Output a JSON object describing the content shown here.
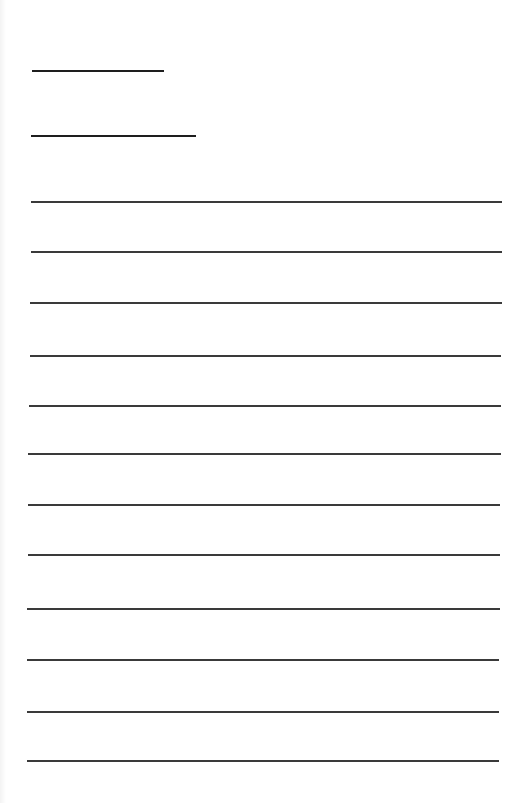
{
  "document": {
    "type": "blank lined form",
    "line_color": "#2b2b2b",
    "header_lines": [
      {
        "x1": 32,
        "x2": 164,
        "y": 71
      },
      {
        "x1": 31,
        "x2": 196,
        "y": 136
      }
    ],
    "body_lines": [
      {
        "x1": 31,
        "x2": 502,
        "y": 202
      },
      {
        "x1": 31,
        "x2": 502,
        "y": 252
      },
      {
        "x1": 30,
        "x2": 502,
        "y": 303
      },
      {
        "x1": 30,
        "x2": 501,
        "y": 356
      },
      {
        "x1": 29,
        "x2": 501,
        "y": 406
      },
      {
        "x1": 28,
        "x2": 501,
        "y": 454
      },
      {
        "x1": 28,
        "x2": 500,
        "y": 505
      },
      {
        "x1": 28,
        "x2": 500,
        "y": 555
      },
      {
        "x1": 27,
        "x2": 500,
        "y": 609
      },
      {
        "x1": 27,
        "x2": 499,
        "y": 660
      },
      {
        "x1": 27,
        "x2": 499,
        "y": 712
      },
      {
        "x1": 27,
        "x2": 499,
        "y": 761
      }
    ]
  }
}
